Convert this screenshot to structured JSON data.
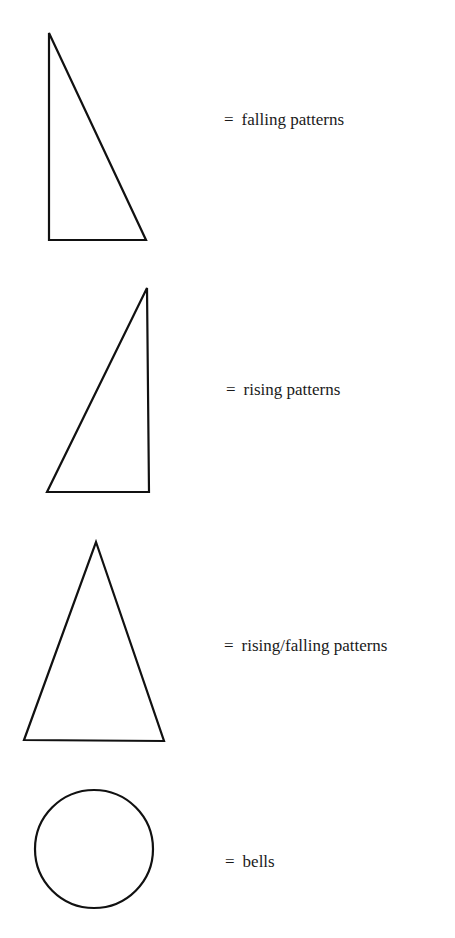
{
  "legend": {
    "items": [
      {
        "symbol": "right-triangle-falling",
        "equals": "=",
        "text": "falling patterns"
      },
      {
        "symbol": "right-triangle-rising",
        "equals": "=",
        "text": "rising patterns"
      },
      {
        "symbol": "isosceles-triangle",
        "equals": "=",
        "text": "rising/falling patterns"
      },
      {
        "symbol": "circle",
        "equals": "=",
        "text": "bells"
      }
    ]
  },
  "colors": {
    "stroke": "#111111",
    "background": "#ffffff"
  }
}
